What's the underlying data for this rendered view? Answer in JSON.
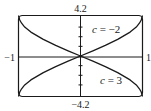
{
  "chart_data": {
    "type": "line",
    "title": "",
    "xlabel": "",
    "ylabel": "",
    "xlim": [
      -1,
      1
    ],
    "ylim": [
      -4.2,
      4.2
    ],
    "grid": false,
    "tick_labels": {
      "x_min": "−1",
      "x_max": "1",
      "y_max": "4.2",
      "y_min": "−4.2"
    },
    "y_minor_ticks": [
      -3,
      -2,
      -1,
      1,
      2,
      3
    ],
    "series": [
      {
        "name": "c = −2",
        "label_c": "c",
        "label_eq": " = −2",
        "x": [
          -1,
          -0.98,
          -0.95,
          -0.9,
          -0.8,
          -0.6,
          -0.4,
          -0.2,
          0,
          0.2,
          0.4,
          0.6,
          0.8,
          0.9,
          0.95,
          0.98,
          1
        ],
        "y": [
          -4.2,
          -3.73,
          -3.4,
          -3.0,
          -2.48,
          -1.72,
          -1.1,
          -0.54,
          0,
          0.54,
          1.1,
          1.72,
          2.48,
          3.0,
          3.4,
          3.73,
          4.2
        ]
      },
      {
        "name": "c = 3",
        "label_c": "c",
        "label_eq": " = 3",
        "x": [
          -1,
          -0.98,
          -0.95,
          -0.9,
          -0.8,
          -0.6,
          -0.4,
          -0.2,
          0,
          0.2,
          0.4,
          0.6,
          0.8,
          0.9,
          0.95,
          0.98,
          1
        ],
        "y": [
          4.2,
          3.73,
          3.4,
          3.0,
          2.48,
          1.72,
          1.1,
          0.54,
          0,
          -0.54,
          -1.1,
          -1.72,
          -2.48,
          -3.0,
          -3.4,
          -3.73,
          -4.2
        ]
      }
    ]
  }
}
